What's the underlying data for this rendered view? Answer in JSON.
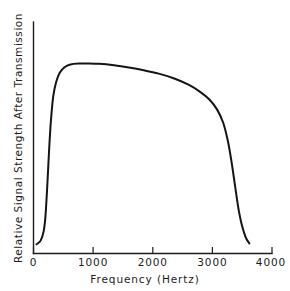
{
  "chart_data": {
    "type": "line",
    "title": "",
    "xlabel": "Frequency (Hertz)",
    "ylabel": "Relative Signal Strength After Transmission",
    "xlim": [
      0,
      4000
    ],
    "ylim": [
      0,
      1.08
    ],
    "grid": false,
    "legend": null,
    "xticks": [
      0,
      1000,
      2000,
      3000,
      4000
    ],
    "xticklabels": [
      "0",
      "1000",
      "2000",
      "3000",
      "4000"
    ],
    "yticks": [],
    "yticklabels": [],
    "series": [
      {
        "name": "Transmitted signal strength",
        "color": "#141414",
        "x": [
          50,
          120,
          170,
          200,
          230,
          260,
          290,
          330,
          380,
          440,
          520,
          620,
          760,
          900,
          1100,
          1350,
          1600,
          1850,
          2100,
          2350,
          2600,
          2800,
          2950,
          3080,
          3180,
          3260,
          3320,
          3370,
          3410,
          3450,
          3490,
          3530,
          3570,
          3620
        ],
        "y": [
          0.02,
          0.04,
          0.09,
          0.17,
          0.33,
          0.52,
          0.68,
          0.82,
          0.9,
          0.95,
          0.98,
          0.995,
          1.0,
          1.0,
          0.998,
          0.99,
          0.978,
          0.963,
          0.945,
          0.92,
          0.885,
          0.845,
          0.805,
          0.75,
          0.68,
          0.58,
          0.47,
          0.36,
          0.27,
          0.19,
          0.13,
          0.085,
          0.05,
          0.025
        ]
      }
    ]
  },
  "axes": {
    "x_axis_name": "frequency-axis",
    "y_axis_name": "signal-strength-axis"
  }
}
